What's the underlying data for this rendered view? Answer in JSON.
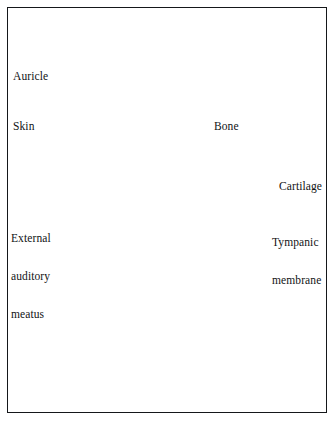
{
  "figure": {
    "kind": "anatomical-line-drawing",
    "background_color": "#ffffff",
    "ink_color": "#15171a",
    "frame_color": "#15171a",
    "frame": {
      "x": 7,
      "y": 7,
      "width": 320,
      "height": 406,
      "stroke_width": 1.5
    }
  },
  "labels": [
    {
      "id": "auricle",
      "name": "Auricle",
      "lines": [
        "Auricle"
      ],
      "x": 13,
      "y": 45,
      "leader": {
        "x1": 47,
        "y1": 53,
        "x2": 89,
        "y2": 79
      }
    },
    {
      "id": "skin",
      "name": "Skin",
      "lines": [
        "Skin"
      ],
      "x": 13,
      "y": 95,
      "leader": {
        "x1": 40,
        "y1": 106,
        "x2": 133,
        "y2": 120
      }
    },
    {
      "id": "external-auditory-meatus",
      "name": "External auditory meatus",
      "lines": [
        "External",
        "auditory",
        "meatus"
      ],
      "x": 11,
      "y": 207,
      "leader": {
        "x1": 57,
        "y1": 240,
        "x2": 133,
        "y2": 240
      }
    },
    {
      "id": "bone",
      "name": "Bone",
      "lines": [
        "Bone"
      ],
      "x": 214,
      "y": 95,
      "leader": {
        "x1": 212,
        "y1": 108,
        "x2": 167,
        "y2": 197
      }
    },
    {
      "id": "cartilage",
      "name": "Cartilage",
      "lines": [
        "Cartilage"
      ],
      "x": 279,
      "y": 155,
      "leader": {
        "x1": 275,
        "y1": 163,
        "x2": 145,
        "y2": 216
      }
    },
    {
      "id": "tympanic-membrane",
      "name": "Tympanic membrane",
      "lines": [
        "Tympanic",
        "membrane"
      ],
      "x": 272,
      "y": 211,
      "leader": {
        "x1": 268,
        "y1": 220,
        "x2": 233,
        "y2": 233
      }
    }
  ]
}
